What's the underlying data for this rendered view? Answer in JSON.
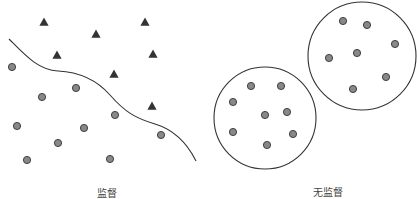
{
  "colors": {
    "background": "#ffffff",
    "stroke": "#333333",
    "circle_fill": "#888888",
    "triangle_fill": "#333333",
    "label": "#444444"
  },
  "supervised": {
    "label": "监督",
    "label_pos": [
      107,
      185
    ],
    "triangles": [
      [
        44,
        22
      ],
      [
        96,
        34
      ],
      [
        145,
        22
      ],
      [
        57,
        55
      ],
      [
        153,
        54
      ],
      [
        114,
        74
      ],
      [
        152,
        106
      ]
    ],
    "circles": [
      [
        12,
        67
      ],
      [
        42,
        97
      ],
      [
        76,
        88
      ],
      [
        115,
        115
      ],
      [
        17,
        126
      ],
      [
        84,
        128
      ],
      [
        58,
        143
      ],
      [
        27,
        160
      ],
      [
        110,
        159
      ],
      [
        161,
        135
      ]
    ],
    "boundary_path": "M9,39 C25,55 38,70 58,71 C78,72 95,78 110,95 C125,112 135,118 155,124 C175,130 188,145 196,161"
  },
  "unsupervised": {
    "label": "无监督",
    "label_pos": [
      328,
      184
    ],
    "clusters": [
      {
        "center": [
          265,
          118
        ],
        "r": 51,
        "points": [
          [
            251,
            86
          ],
          [
            281,
            86
          ],
          [
            233,
            102
          ],
          [
            265,
            115
          ],
          [
            287,
            112
          ],
          [
            233,
            132
          ],
          [
            293,
            134
          ],
          [
            267,
            145
          ]
        ]
      },
      {
        "center": [
          362,
          56
        ],
        "r": 54,
        "points": [
          [
            343,
            21
          ],
          [
            367,
            25
          ],
          [
            395,
            44
          ],
          [
            329,
            58
          ],
          [
            357,
            53
          ],
          [
            386,
            77
          ],
          [
            353,
            89
          ]
        ]
      }
    ]
  }
}
